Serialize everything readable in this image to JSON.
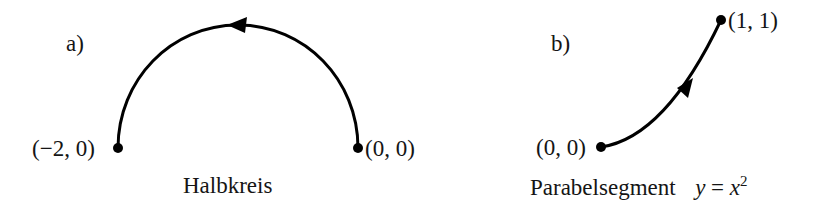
{
  "panels": [
    {
      "id": "a",
      "tag": "a)",
      "caption": "Halbkreis",
      "start_point": {
        "label": "(0, 0)",
        "x": 0,
        "y": 0
      },
      "end_point": {
        "label": "(−2, 0)",
        "x": -2,
        "y": 0
      },
      "curve": "semicircle",
      "direction": "counterclockwise, from (0,0) to (−2,0)"
    },
    {
      "id": "b",
      "tag": "b)",
      "caption_text": "Parabelsegment",
      "caption_math": {
        "lhs": "y",
        "eq": "=",
        "base": "x",
        "exp": "2"
      },
      "start_point": {
        "label": "(0, 0)",
        "x": 0,
        "y": 0
      },
      "end_point": {
        "label": "(1, 1)",
        "x": 1,
        "y": 1
      },
      "curve": "parabola y = x^2",
      "direction": "from (0,0) to (1,1)"
    }
  ],
  "colors": {
    "stroke": "#000000",
    "text": "#151515",
    "background": "#ffffff"
  }
}
